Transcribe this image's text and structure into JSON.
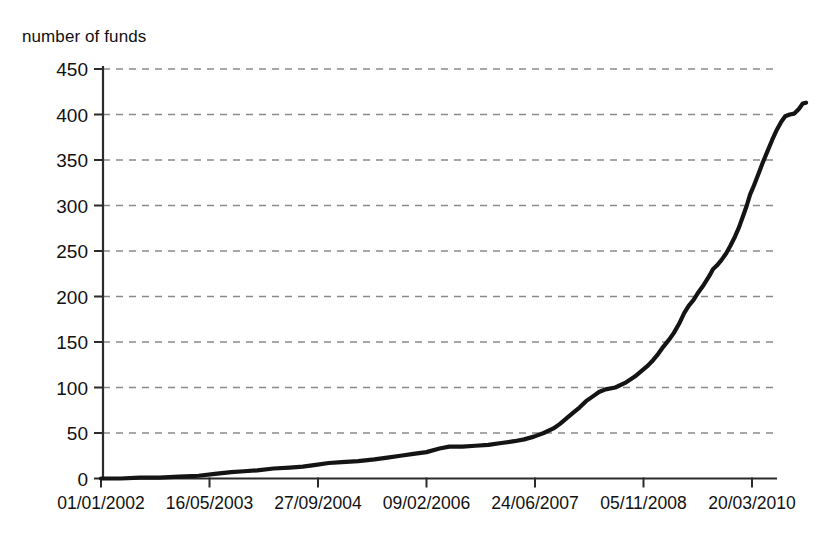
{
  "chart_data": {
    "type": "line",
    "title": "",
    "xlabel": "",
    "ylabel": "number of funds",
    "ylim": [
      0,
      450
    ],
    "yticks": [
      0,
      50,
      100,
      150,
      200,
      250,
      300,
      350,
      400,
      450
    ],
    "ytick_labels": [
      "0",
      "50",
      "100",
      "150",
      "200",
      "250",
      "300",
      "350",
      "400",
      "450"
    ],
    "xtick_labels": [
      "01/01/2002",
      "16/05/2003",
      "27/09/2004",
      "09/02/2006",
      "24/06/2007",
      "05/11/2008",
      "20/03/2010"
    ],
    "grid": "horizontal-dashed",
    "legend": "none",
    "line_color": "#141414",
    "grid_color": "#8a8a8a",
    "axis_color": "#2b2b2b",
    "series": [
      {
        "name": "cumulative number of funds",
        "x": [
          "01/01/2002",
          "16/05/2003",
          "27/09/2004",
          "09/02/2006",
          "24/06/2007",
          "05/11/2008",
          "20/03/2010"
        ],
        "values": [
          0,
          5,
          18,
          34,
          96,
          247,
          413
        ],
        "points": [
          [
            0.0,
            0
          ],
          [
            0.03,
            0
          ],
          [
            0.06,
            1
          ],
          [
            0.09,
            1
          ],
          [
            0.12,
            2
          ],
          [
            0.15,
            3
          ],
          [
            0.175,
            5
          ],
          [
            0.2,
            7
          ],
          [
            0.22,
            8
          ],
          [
            0.24,
            9
          ],
          [
            0.265,
            11
          ],
          [
            0.29,
            12
          ],
          [
            0.31,
            13
          ],
          [
            0.33,
            15
          ],
          [
            0.35,
            17
          ],
          [
            0.37,
            18
          ],
          [
            0.395,
            19
          ],
          [
            0.42,
            21
          ],
          [
            0.44,
            23
          ],
          [
            0.46,
            25
          ],
          [
            0.48,
            27
          ],
          [
            0.5,
            29
          ],
          [
            0.52,
            33
          ],
          [
            0.535,
            35
          ],
          [
            0.555,
            35
          ],
          [
            0.575,
            36
          ],
          [
            0.595,
            37
          ],
          [
            0.615,
            39
          ],
          [
            0.635,
            41
          ],
          [
            0.65,
            43
          ],
          [
            0.665,
            46
          ],
          [
            0.68,
            50
          ],
          [
            0.695,
            55
          ],
          [
            0.705,
            60
          ],
          [
            0.715,
            66
          ],
          [
            0.725,
            72
          ],
          [
            0.735,
            78
          ],
          [
            0.745,
            85
          ],
          [
            0.755,
            90
          ],
          [
            0.765,
            95
          ],
          [
            0.775,
            98
          ],
          [
            0.79,
            100
          ],
          [
            0.805,
            105
          ],
          [
            0.82,
            112
          ],
          [
            0.83,
            118
          ],
          [
            0.84,
            124
          ],
          [
            0.848,
            130
          ],
          [
            0.856,
            137
          ],
          [
            0.864,
            145
          ],
          [
            0.872,
            152
          ],
          [
            0.88,
            160
          ],
          [
            0.888,
            170
          ],
          [
            0.896,
            182
          ],
          [
            0.903,
            190
          ],
          [
            0.91,
            196
          ],
          [
            0.918,
            205
          ],
          [
            0.926,
            213
          ],
          [
            0.934,
            222
          ],
          [
            0.94,
            230
          ],
          [
            0.946,
            234
          ],
          [
            0.953,
            240
          ],
          [
            0.96,
            247
          ],
          [
            0.967,
            256
          ],
          [
            0.974,
            266
          ],
          [
            0.98,
            276
          ],
          [
            0.986,
            288
          ],
          [
            0.992,
            300
          ],
          [
            0.997,
            312
          ],
          [
            1.003,
            322
          ],
          [
            1.01,
            335
          ],
          [
            1.017,
            348
          ],
          [
            1.024,
            360
          ],
          [
            1.031,
            372
          ],
          [
            1.038,
            383
          ],
          [
            1.045,
            392
          ],
          [
            1.051,
            398
          ],
          [
            1.058,
            400
          ],
          [
            1.065,
            401
          ],
          [
            1.072,
            406
          ],
          [
            1.078,
            412
          ],
          [
            1.083,
            413
          ]
        ]
      }
    ]
  }
}
